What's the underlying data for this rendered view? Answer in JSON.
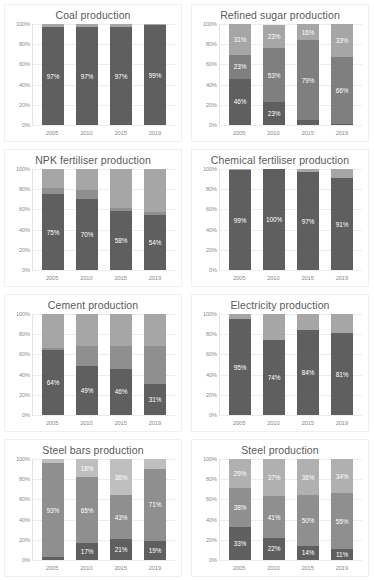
{
  "figure": {
    "columns": 2,
    "rows": 4,
    "axis": {
      "y_ticks": [
        "100%",
        "80%",
        "60%",
        "40%",
        "20%",
        "0%"
      ],
      "y_tick_values": [
        100,
        80,
        60,
        40,
        20,
        0
      ],
      "ylim": [
        0,
        100
      ],
      "categories": [
        "2005",
        "2010",
        "2015",
        "2019"
      ],
      "grid": true,
      "legend": "none"
    },
    "colors": {
      "dark": "#5f5f5f",
      "mid": "#7f7f7f",
      "light": "#a6a6a6",
      "lighter": "#bfbfbf",
      "label_text": "#ffffff",
      "tick_text": "#8c8c8c",
      "title_text": "#5a5a5a",
      "panel_border": "#efefef",
      "gridline": "#ededed",
      "background": "#ffffff"
    }
  },
  "chart_data": [
    {
      "type": "bar",
      "subtype": "stacked-percent",
      "title": "Coal production",
      "xlabel": "",
      "ylabel": "",
      "ylim": [
        0,
        100
      ],
      "grid": true,
      "categories": [
        "2005",
        "2010",
        "2015",
        "2019"
      ],
      "series": [
        {
          "name": "primary",
          "color": "#5f5f5f",
          "values": [
            97,
            97,
            97,
            99
          ],
          "labels": [
            "97%",
            "97%",
            "97%",
            "99%"
          ]
        },
        {
          "name": "remainder",
          "color": "#a6a6a6",
          "values": [
            3,
            3,
            3,
            1
          ],
          "labels": [
            "",
            "",
            "",
            ""
          ]
        }
      ]
    },
    {
      "type": "bar",
      "subtype": "stacked-percent",
      "title": "Refined sugar production",
      "xlabel": "",
      "ylabel": "",
      "ylim": [
        0,
        100
      ],
      "grid": true,
      "categories": [
        "2005",
        "2010",
        "2015",
        "2019"
      ],
      "series": [
        {
          "name": "bottom",
          "color": "#5f5f5f",
          "values": [
            46,
            23,
            5,
            1
          ],
          "labels": [
            "46%",
            "23%",
            "",
            ""
          ]
        },
        {
          "name": "middle",
          "color": "#7f7f7f",
          "values": [
            23,
            53,
            79,
            66
          ],
          "labels": [
            "23%",
            "53%",
            "79%",
            "66%"
          ]
        },
        {
          "name": "top",
          "color": "#a6a6a6",
          "values": [
            31,
            23,
            16,
            33
          ],
          "labels": [
            "31%",
            "23%",
            "16%",
            "33%"
          ]
        }
      ]
    },
    {
      "type": "bar",
      "subtype": "stacked-percent",
      "title": "NPK fertiliser production",
      "xlabel": "",
      "ylabel": "",
      "ylim": [
        0,
        100
      ],
      "grid": true,
      "categories": [
        "2005",
        "2010",
        "2015",
        "2019"
      ],
      "series": [
        {
          "name": "bottom",
          "color": "#5f5f5f",
          "values": [
            75,
            70,
            58,
            54
          ],
          "labels": [
            "75%",
            "70%",
            "58%",
            "54%"
          ]
        },
        {
          "name": "middle",
          "color": "#8f8f8f",
          "values": [
            6,
            9,
            3,
            3
          ],
          "labels": [
            "",
            "",
            "",
            ""
          ]
        },
        {
          "name": "top",
          "color": "#a6a6a6",
          "values": [
            19,
            21,
            39,
            43
          ],
          "labels": [
            "",
            "",
            "",
            ""
          ]
        }
      ]
    },
    {
      "type": "bar",
      "subtype": "stacked-percent",
      "title": "Chemical fertiliser production",
      "xlabel": "",
      "ylabel": "",
      "ylim": [
        0,
        100
      ],
      "grid": true,
      "categories": [
        "2005",
        "2010",
        "2015",
        "2019"
      ],
      "series": [
        {
          "name": "primary",
          "color": "#5f5f5f",
          "values": [
            99,
            100,
            97,
            91
          ],
          "labels": [
            "99%",
            "100%",
            "97%",
            "91%"
          ]
        },
        {
          "name": "remainder",
          "color": "#a6a6a6",
          "values": [
            1,
            0,
            3,
            9
          ],
          "labels": [
            "",
            "",
            "",
            ""
          ]
        }
      ]
    },
    {
      "type": "bar",
      "subtype": "stacked-percent",
      "title": "Cement production",
      "xlabel": "",
      "ylabel": "",
      "ylim": [
        0,
        100
      ],
      "grid": true,
      "categories": [
        "2005",
        "2010",
        "2015",
        "2019"
      ],
      "series": [
        {
          "name": "bottom",
          "color": "#5f5f5f",
          "values": [
            64,
            49,
            46,
            31
          ],
          "labels": [
            "64%",
            "49%",
            "46%",
            "31%"
          ]
        },
        {
          "name": "middle",
          "color": "#8f8f8f",
          "values": [
            2,
            19,
            22,
            37
          ],
          "labels": [
            "",
            "",
            "",
            ""
          ]
        },
        {
          "name": "top",
          "color": "#a6a6a6",
          "values": [
            34,
            32,
            32,
            32
          ],
          "labels": [
            "",
            "",
            "",
            ""
          ]
        }
      ]
    },
    {
      "type": "bar",
      "subtype": "stacked-percent",
      "title": "Electricity production",
      "xlabel": "",
      "ylabel": "",
      "ylim": [
        0,
        100
      ],
      "grid": true,
      "categories": [
        "2005",
        "2010",
        "2015",
        "2019"
      ],
      "series": [
        {
          "name": "bottom",
          "color": "#5f5f5f",
          "values": [
            95,
            74,
            84,
            81
          ],
          "labels": [
            "95%",
            "74%",
            "84%",
            "81%"
          ]
        },
        {
          "name": "top",
          "color": "#a6a6a6",
          "values": [
            5,
            26,
            16,
            19
          ],
          "labels": [
            "",
            "",
            "",
            ""
          ]
        }
      ]
    },
    {
      "type": "bar",
      "subtype": "stacked-percent",
      "title": "Steel bars production",
      "xlabel": "",
      "ylabel": "",
      "ylim": [
        0,
        100
      ],
      "grid": true,
      "categories": [
        "2005",
        "2010",
        "2015",
        "2019"
      ],
      "series": [
        {
          "name": "bottom",
          "color": "#5f5f5f",
          "values": [
            3,
            17,
            21,
            19
          ],
          "labels": [
            "",
            "17%",
            "21%",
            "19%"
          ]
        },
        {
          "name": "middle",
          "color": "#8f8f8f",
          "values": [
            93,
            65,
            43,
            71
          ],
          "labels": [
            "93%",
            "65%",
            "43%",
            "71%"
          ]
        },
        {
          "name": "top",
          "color": "#bfbfbf",
          "values": [
            4,
            18,
            36,
            10
          ],
          "labels": [
            "",
            "18%",
            "36%",
            ""
          ]
        }
      ]
    },
    {
      "type": "bar",
      "subtype": "stacked-percent",
      "title": "Steel production",
      "xlabel": "",
      "ylabel": "",
      "ylim": [
        0,
        100
      ],
      "grid": true,
      "categories": [
        "2005",
        "2010",
        "2015",
        "2019"
      ],
      "series": [
        {
          "name": "bottom",
          "color": "#5f5f5f",
          "values": [
            33,
            22,
            14,
            11
          ],
          "labels": [
            "33%",
            "22%",
            "14%",
            "11%"
          ]
        },
        {
          "name": "middle",
          "color": "#8f8f8f",
          "values": [
            38,
            41,
            50,
            55
          ],
          "labels": [
            "38%",
            "41%",
            "50%",
            "55%"
          ]
        },
        {
          "name": "top",
          "color": "#b0b0b0",
          "values": [
            29,
            37,
            36,
            34
          ],
          "labels": [
            "29%",
            "37%",
            "36%",
            "34%"
          ]
        }
      ]
    }
  ]
}
